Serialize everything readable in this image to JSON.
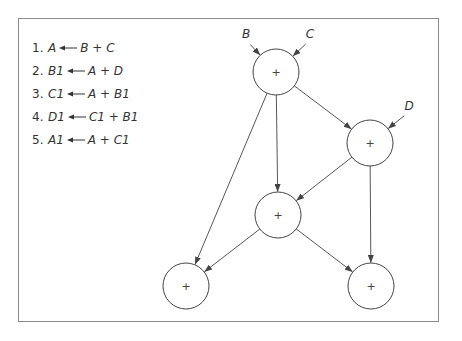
{
  "equations": [
    {
      "num": "1.",
      "lhs": "A",
      "rhs": "B + C"
    },
    {
      "num": "2.",
      "lhs": "B1",
      "rhs": "A + D"
    },
    {
      "num": "3.",
      "lhs": "C1",
      "rhs": "A + B1"
    },
    {
      "num": "4.",
      "lhs": "D1",
      "rhs": "C1 + B1"
    },
    {
      "num": "5.",
      "lhs": "A1",
      "rhs": "A + C1"
    }
  ],
  "graph": {
    "nodes": [
      {
        "id": "n1",
        "op": "+",
        "cx": 276,
        "cy": 72
      },
      {
        "id": "n2",
        "op": "+",
        "cx": 370,
        "cy": 143
      },
      {
        "id": "n3",
        "op": "+",
        "cx": 278,
        "cy": 215
      },
      {
        "id": "n4",
        "op": "+",
        "cx": 186,
        "cy": 286
      },
      {
        "id": "n5",
        "op": "+",
        "cx": 371,
        "cy": 286
      }
    ],
    "inputs": [
      {
        "label": "B",
        "x": 246,
        "y": 40
      },
      {
        "label": "C",
        "x": 310,
        "y": 40
      },
      {
        "label": "D",
        "x": 409,
        "y": 112
      }
    ],
    "edges": [
      {
        "from": "B",
        "to": "n1"
      },
      {
        "from": "C",
        "to": "n1"
      },
      {
        "from": "D",
        "to": "n2"
      },
      {
        "from": "n1",
        "to": "n2"
      },
      {
        "from": "n1",
        "to": "n3"
      },
      {
        "from": "n1",
        "to": "n4"
      },
      {
        "from": "n2",
        "to": "n3"
      },
      {
        "from": "n2",
        "to": "n5"
      },
      {
        "from": "n3",
        "to": "n4"
      },
      {
        "from": "n3",
        "to": "n5"
      }
    ]
  },
  "colors": {
    "stroke": "#444444",
    "frame": "#8a8a8a",
    "text": "#333333"
  }
}
